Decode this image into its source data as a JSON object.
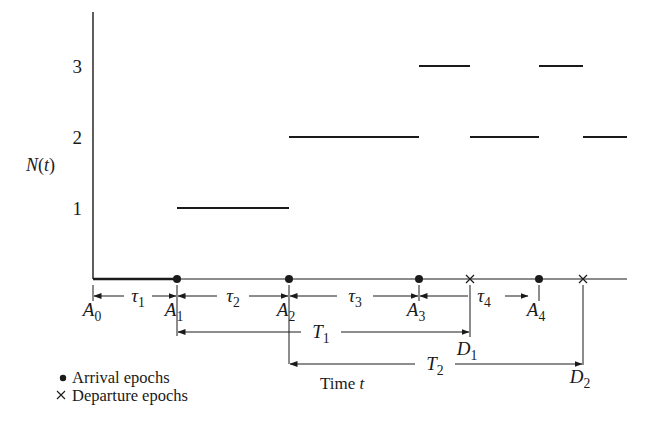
{
  "figure": {
    "y_axis_label": "N(t)",
    "x_axis_label": "Time t",
    "y_ticks": [
      {
        "label": "1",
        "value": 1
      },
      {
        "label": "2",
        "value": 2
      },
      {
        "label": "3",
        "value": 3
      }
    ],
    "legend": [
      {
        "symbol": "●",
        "label": "Arrival epochs"
      },
      {
        "symbol": "×",
        "label": "Departure epochs"
      }
    ],
    "colors": {
      "ink": "#1a1a1a",
      "background": "#ffffff"
    }
  },
  "chart_data": {
    "type": "line",
    "subtype": "step",
    "title": "",
    "xlabel": "Time t",
    "ylabel": "N(t)",
    "ylim": [
      0,
      3.7
    ],
    "yticks": [
      1,
      2,
      3
    ],
    "grid": false,
    "events": [
      {
        "name": "A0",
        "kind": "origin",
        "x": 93
      },
      {
        "name": "A1",
        "kind": "arrival",
        "x": 177
      },
      {
        "name": "A2",
        "kind": "arrival",
        "x": 289
      },
      {
        "name": "A3",
        "kind": "arrival",
        "x": 419
      },
      {
        "name": "D1",
        "kind": "departure",
        "x": 470
      },
      {
        "name": "A4",
        "kind": "arrival",
        "x": 539
      },
      {
        "name": "D2",
        "kind": "departure",
        "x": 583
      }
    ],
    "steps": [
      {
        "from": "A0",
        "to": "A1",
        "N": 0
      },
      {
        "from": "A1",
        "to": "A2",
        "N": 1
      },
      {
        "from": "A2",
        "to": "A3",
        "N": 2
      },
      {
        "from": "A3",
        "to": "D1",
        "N": 3
      },
      {
        "from": "D1",
        "to": "A4",
        "N": 2
      },
      {
        "from": "A4",
        "to": "D2",
        "N": 3
      },
      {
        "from": "D2",
        "to": "end",
        "N": 2
      }
    ],
    "interarrival_intervals": [
      {
        "label": "τ1",
        "from": "A0",
        "to": "A1"
      },
      {
        "label": "τ2",
        "from": "A1",
        "to": "A2"
      },
      {
        "label": "τ3",
        "from": "A2",
        "to": "A3"
      },
      {
        "label": "τ4",
        "from": "A3",
        "to": "A4"
      }
    ],
    "system_times": [
      {
        "label": "T1",
        "from": "A1",
        "to": "D1"
      },
      {
        "label": "T2",
        "from": "A2",
        "to": "D2"
      }
    ],
    "legend": [
      "Arrival epochs",
      "Departure epochs"
    ],
    "legend_position": "bottom-left"
  }
}
